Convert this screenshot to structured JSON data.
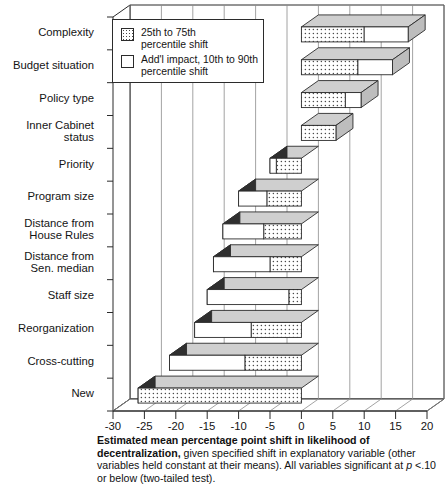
{
  "chart_data": {
    "type": "bar",
    "orientation": "horizontal",
    "title": "",
    "xlabel": "",
    "ylabel": "",
    "xlim": [
      -30,
      20
    ],
    "xticks": [
      -30,
      -25,
      -20,
      -15,
      -10,
      -5,
      0,
      5,
      10,
      15,
      20
    ],
    "xtick_labels": [
      "-30",
      "-25",
      "-20",
      "-15",
      "-10",
      "-5",
      "0",
      "5",
      "10",
      "15",
      "20"
    ],
    "grid": true,
    "grid_axis": "x",
    "style": "3d-horizontal-stacked-bar",
    "legend_position": "upper-left-inside",
    "categories": [
      "Complexity",
      "Budget situation",
      "Policy type",
      "Inner Cabinet\nstatus",
      "Priority",
      "Program size",
      "Distance from\nHouse Rules",
      "Distance from\nSen. median",
      "Staff size",
      "Reorganization",
      "Cross-cutting",
      "New"
    ],
    "series": [
      {
        "name": "25th to 75th percentile shift",
        "fill": "dotted",
        "values": [
          10.0,
          9.0,
          7.0,
          5.5,
          -4.0,
          -5.5,
          -6.0,
          -5.0,
          -2.0,
          -8.0,
          -9.0,
          -26.0
        ]
      },
      {
        "name": "Add'l impact, 10th to 90th percentile shift",
        "fill": "white",
        "values": [
          7.0,
          5.5,
          2.5,
          0.0,
          -1.0,
          -4.5,
          -6.5,
          -9.0,
          -13.0,
          -9.0,
          -12.0,
          0.0
        ]
      }
    ],
    "totals": [
      17.0,
      14.5,
      9.5,
      5.5,
      -5.0,
      -10.0,
      -12.5,
      -14.0,
      -15.0,
      -17.0,
      -21.0,
      -26.0
    ]
  },
  "legend": {
    "items": [
      {
        "swatch": "dotted",
        "label": "25th to 75th\npercentile shift"
      },
      {
        "swatch": "white",
        "label": "Add'l impact, 10th to 90th\npercentile shift"
      }
    ]
  },
  "caption": {
    "bold_lead": "Estimated mean percentage point shift in likelihood of decentralization,",
    "rest": " given specified shift in explanatory variable (other variables held constant at their means). All variables significant at ",
    "italic_p": "p",
    "tail": " <.10 or below (two-tailed test)."
  },
  "colors": {
    "frame": "#2b2b2b",
    "grid": "#8c8c8c",
    "dot": "#4a4a4a",
    "bar_side": "#2f2f2f",
    "bar_top": "#cfcfcf",
    "text": "#141414"
  }
}
